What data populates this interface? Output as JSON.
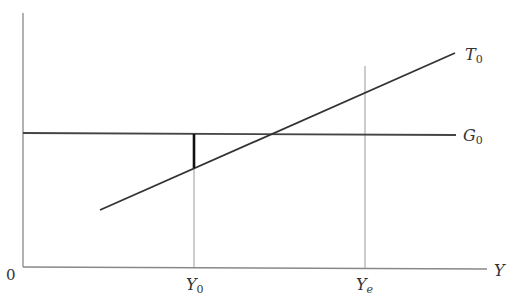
{
  "diagram": {
    "origin_label": "0",
    "x_axis_label": "Y",
    "ticks": [
      {
        "base": "Y",
        "sub": "0",
        "x": 194
      },
      {
        "base": "Y",
        "sub": "e",
        "x": 365
      }
    ],
    "lines": [
      {
        "name": "T",
        "sub": "0",
        "description": "upward-sloping tax line"
      },
      {
        "name": "G",
        "sub": "0",
        "description": "horizontal government spending line"
      }
    ],
    "gap_segment": "deficit at Y0 (G0 above T0)"
  },
  "colors": {
    "axis": "#888888",
    "line": "#333333",
    "gap": "#111111"
  }
}
